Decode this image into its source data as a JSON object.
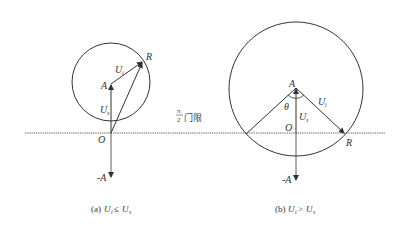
{
  "threshold": {
    "numerator": "π",
    "denominator": "2",
    "text": "门限"
  },
  "diagram_a": {
    "caption_prefix": "(a) ",
    "caption_var1": "U",
    "caption_sub1": "i",
    "caption_op": "≤",
    "caption_var2": "U",
    "caption_sub2": "s",
    "points": {
      "R": "R",
      "A": "A",
      "O": "O",
      "negA": "-A"
    },
    "vectors": {
      "Ui_main": "U",
      "Ui_sub": "i",
      "Us_main": "U",
      "Us_sub": "s"
    }
  },
  "diagram_b": {
    "caption_prefix": "(b) ",
    "caption_var1": "U",
    "caption_sub1": "i",
    "caption_op": ">",
    "caption_var2": "U",
    "caption_sub2": "s",
    "points": {
      "R": "R",
      "A": "A",
      "O": "O",
      "negA": "-A"
    },
    "angle": "θ",
    "vectors": {
      "Ui_main": "U",
      "Ui_sub": "i",
      "Us_main": "U",
      "Us_sub": "s"
    }
  },
  "colors": {
    "stroke": "#333333",
    "dotted": "#555555",
    "background": "#ffffff"
  }
}
